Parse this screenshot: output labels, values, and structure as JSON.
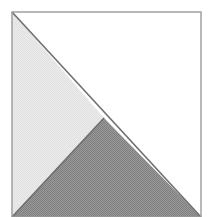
{
  "figure": {
    "canvas": {
      "width": 211,
      "height": 217
    },
    "frame": {
      "label": "square-outline",
      "x": 12,
      "y": 12,
      "width": 189,
      "height": 205,
      "stroke_color": "#9a9a9a",
      "stroke_width": 1.4,
      "fill_color": "#ffffff"
    },
    "regions": [
      {
        "name": "white-triangle",
        "label": "Upper right white triangle",
        "points": "12,12 201,12 201,217 104,118",
        "fill_color": "#ffffff",
        "shade": "white"
      },
      {
        "name": "light-gray-triangle",
        "label": "Left light gray triangle",
        "points": "12,12 104,118 12,217",
        "fill_color": "#e6e6e6",
        "shade": "light"
      },
      {
        "name": "dark-gray-triangle",
        "label": "Bottom dark gray triangle",
        "points": "12,217 104,118 201,217",
        "fill_color": "#919191",
        "shade": "dark"
      }
    ],
    "edges": [
      {
        "name": "main-diagonal",
        "label": "Diagonal from top-left to bottom-right",
        "x1": 12,
        "y1": 12,
        "x2": 201,
        "y2": 217,
        "stroke_color": "#6f6f6f",
        "stroke_width": 1.6
      },
      {
        "name": "inner-diagonal",
        "label": "Diagonal from apex to bottom-left",
        "x1": 104,
        "y1": 118,
        "x2": 12,
        "y2": 217,
        "stroke_color": "#6f6f6f",
        "stroke_width": 1.6
      }
    ],
    "vertices": [
      {
        "name": "top-left-corner",
        "x": 12,
        "y": 12
      },
      {
        "name": "top-right-corner",
        "x": 201,
        "y": 12
      },
      {
        "name": "bottom-left-corner",
        "x": 12,
        "y": 217
      },
      {
        "name": "bottom-right-corner",
        "x": 201,
        "y": 217
      },
      {
        "name": "interior-apex",
        "x": 104,
        "y": 118
      }
    ]
  }
}
